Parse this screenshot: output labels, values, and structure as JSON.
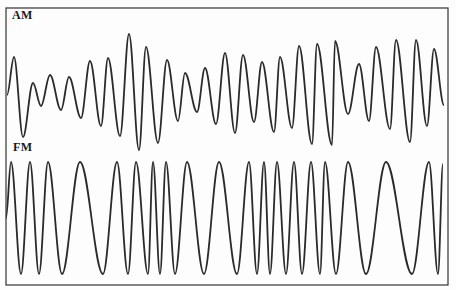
{
  "figure": {
    "colors": {
      "line": "#2a2a2a",
      "frame": "#333333",
      "background": "#fdfdfd"
    },
    "frame": {
      "left": 6,
      "top": 8,
      "right": 448,
      "bottom": 285
    },
    "panels": [
      {
        "label": "AM",
        "kind": "amplitude-modulated-wave",
        "extrema": [
          [
            7,
            95
          ],
          [
            14,
            57
          ],
          [
            23,
            137
          ],
          [
            33,
            83
          ],
          [
            41,
            106
          ],
          [
            50,
            75
          ],
          [
            61,
            110
          ],
          [
            69,
            77
          ],
          [
            81,
            118
          ],
          [
            90,
            61
          ],
          [
            101,
            126
          ],
          [
            108,
            58
          ],
          [
            120,
            136
          ],
          [
            129,
            34
          ],
          [
            139,
            150
          ],
          [
            146,
            47
          ],
          [
            158,
            143
          ],
          [
            167,
            60
          ],
          [
            178,
            121
          ],
          [
            185,
            73
          ],
          [
            197,
            112
          ],
          [
            205,
            68
          ],
          [
            216,
            124
          ],
          [
            225,
            53
          ],
          [
            235,
            133
          ],
          [
            243,
            55
          ],
          [
            254,
            122
          ],
          [
            262,
            62
          ],
          [
            274,
            132
          ],
          [
            280,
            57
          ],
          [
            292,
            128
          ],
          [
            299,
            46
          ],
          [
            312,
            144
          ],
          [
            317,
            44
          ],
          [
            332,
            145
          ],
          [
            335,
            41
          ],
          [
            348,
            114
          ],
          [
            359,
            64
          ],
          [
            369,
            121
          ],
          [
            376,
            47
          ],
          [
            390,
            129
          ],
          [
            396,
            40
          ],
          [
            410,
            142
          ],
          [
            416,
            40
          ],
          [
            427,
            126
          ],
          [
            434,
            49
          ],
          [
            444,
            105
          ]
        ]
      },
      {
        "label": "FM",
        "kind": "frequency-modulated-wave",
        "peak_y": 162,
        "trough_y": 274,
        "extrema_x": [
          6,
          11,
          21,
          30,
          39,
          48,
          62,
          80,
          103,
          117,
          128,
          136,
          148,
          153,
          160,
          166,
          175,
          187,
          204,
          219,
          237,
          249,
          257,
          264,
          270,
          277,
          286,
          294,
          302,
          311,
          320,
          325,
          336,
          348,
          366,
          386,
          412,
          429,
          438,
          443
        ],
        "first_is": "mid"
      }
    ]
  }
}
